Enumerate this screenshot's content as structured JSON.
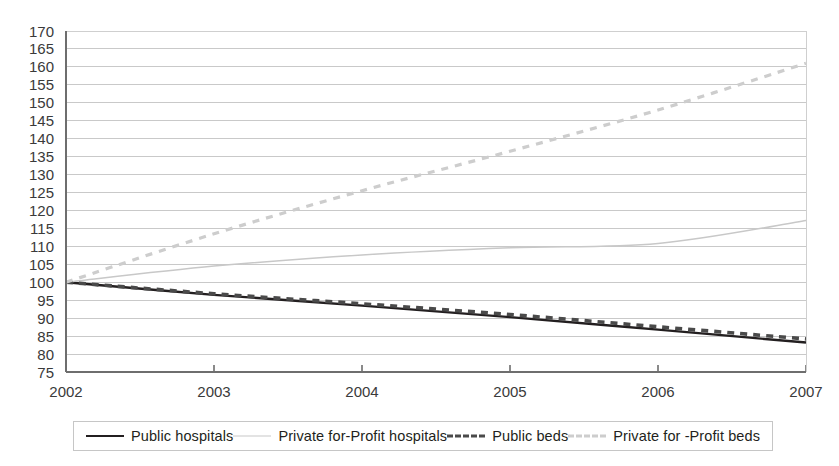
{
  "chart_data": {
    "type": "line",
    "title": "",
    "xlabel": "",
    "ylabel": "",
    "xlim": [
      2002,
      2007
    ],
    "ylim": [
      75,
      170
    ],
    "grid": true,
    "legend_position": "bottom",
    "x": [
      2002,
      2003,
      2004,
      2005,
      2006,
      2007
    ],
    "xtick_labels": [
      "2002",
      "2003",
      "2004",
      "2005",
      "2006",
      "2007"
    ],
    "ytick_labels": [
      "170",
      "165",
      "160",
      "155",
      "150",
      "145",
      "140",
      "135",
      "130",
      "125",
      "120",
      "115",
      "110",
      "105",
      "100",
      "95",
      "90",
      "85",
      "80",
      "75"
    ],
    "ytick_values": [
      170,
      165,
      160,
      155,
      150,
      145,
      140,
      135,
      130,
      125,
      120,
      115,
      110,
      105,
      100,
      95,
      90,
      85,
      80,
      75
    ],
    "series": [
      {
        "name": "Public hospitals",
        "style": "solid",
        "color": "#231f20",
        "values": [
          100,
          96.5,
          93.5,
          90.3,
          86.8,
          83.2
        ]
      },
      {
        "name": "Private for-Profit hospitals",
        "style": "solid",
        "color": "#c8c8c8",
        "values": [
          100,
          104.5,
          107.6,
          109.6,
          110.8,
          117.2
        ]
      },
      {
        "name": "Public beds",
        "style": "dashed",
        "color": "#4a4a4a",
        "values": [
          100,
          96.8,
          94.0,
          91.0,
          87.6,
          84.2
        ]
      },
      {
        "name": "Private for -Profit beds",
        "style": "dashed",
        "color": "#cdcdcd",
        "values": [
          100,
          113.5,
          125.5,
          136.5,
          148.0,
          161.0
        ]
      }
    ]
  },
  "legend": {
    "items": [
      {
        "label": "Public hospitals",
        "swatch": "solid-dark"
      },
      {
        "label": "Private for-Profit hospitals",
        "swatch": "solid-light"
      },
      {
        "label": "Public beds",
        "swatch": "dash-dark"
      },
      {
        "label": "Private for -Profit beds",
        "swatch": "dash-light"
      }
    ]
  }
}
